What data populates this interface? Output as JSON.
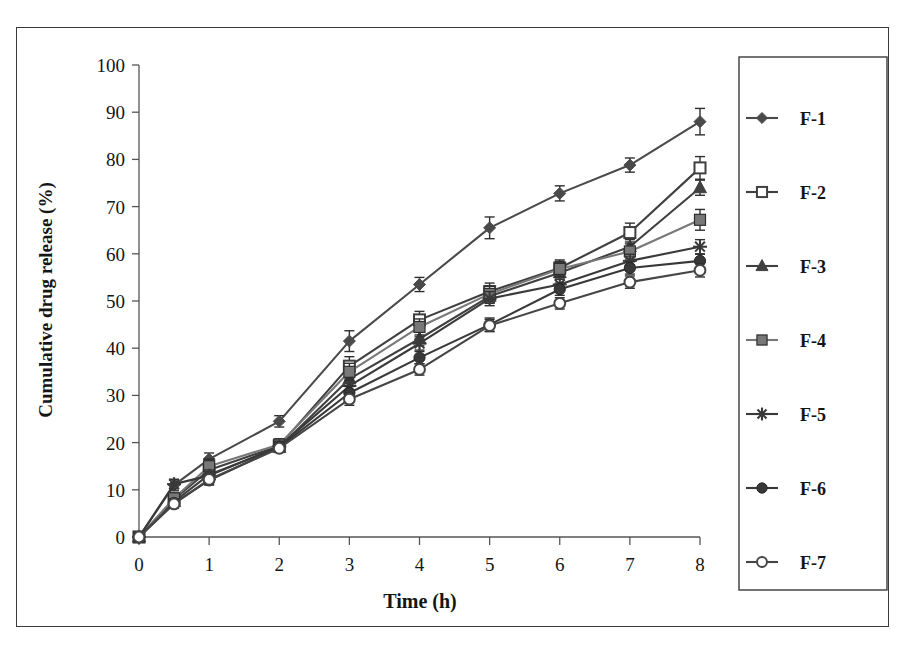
{
  "chart_data": {
    "type": "line",
    "title": "",
    "xlabel": "Time (h)",
    "ylabel": "Cumulative drug release (%)",
    "xlim": [
      0,
      8
    ],
    "ylim": [
      0,
      100
    ],
    "xticks": [
      "0",
      "1",
      "2",
      "3",
      "4",
      "5",
      "6",
      "7",
      "8"
    ],
    "yticks": [
      "0",
      "10",
      "20",
      "30",
      "40",
      "50",
      "60",
      "70",
      "80",
      "90",
      "100"
    ],
    "grid": false,
    "legend_position": "right-outside",
    "error_bars": true,
    "x": [
      0,
      0.5,
      1,
      2,
      3,
      4,
      5,
      6,
      7,
      8
    ],
    "series": [
      {
        "name": "F-1",
        "marker": "filled-diamond",
        "color": "#4a4a4a",
        "values": [
          0,
          11.0,
          16.5,
          24.5,
          41.5,
          53.5,
          65.5,
          72.8,
          78.8,
          88.0
        ],
        "errors": [
          0,
          1.2,
          1.3,
          1.2,
          2.2,
          1.5,
          2.3,
          1.6,
          1.5,
          2.8
        ]
      },
      {
        "name": "F-2",
        "marker": "open-square",
        "color": "#3f3f3f",
        "values": [
          0,
          8.0,
          14.2,
          19.3,
          36.2,
          46.0,
          52.0,
          57.0,
          64.5,
          78.2
        ],
        "errors": [
          0,
          1.0,
          1.4,
          1.2,
          2.0,
          1.8,
          1.8,
          1.7,
          2.0,
          2.4
        ]
      },
      {
        "name": "F-3",
        "marker": "filled-triangle",
        "color": "#404040",
        "values": [
          0,
          7.5,
          13.2,
          19.0,
          33.5,
          42.0,
          51.0,
          56.0,
          61.5,
          74.0
        ],
        "errors": [
          0,
          0.9,
          1.1,
          1.0,
          1.6,
          1.5,
          1.5,
          1.4,
          1.5,
          1.6
        ]
      },
      {
        "name": "F-4",
        "marker": "filled-square",
        "color": "#787878",
        "values": [
          0,
          8.2,
          15.0,
          19.6,
          35.0,
          44.5,
          51.5,
          56.8,
          60.5,
          67.2
        ],
        "errors": [
          0,
          1.1,
          1.5,
          1.2,
          1.8,
          1.7,
          1.7,
          1.6,
          1.6,
          2.2
        ]
      },
      {
        "name": "F-5",
        "marker": "star-asterisk",
        "color": "#3a3a3a",
        "values": [
          0,
          11.2,
          13.0,
          19.2,
          32.0,
          41.0,
          50.5,
          53.5,
          58.5,
          61.5
        ],
        "errors": [
          0,
          1.0,
          1.2,
          1.1,
          1.5,
          1.4,
          1.5,
          1.4,
          1.4,
          1.5
        ]
      },
      {
        "name": "F-6",
        "marker": "filled-circle",
        "color": "#383838",
        "values": [
          0,
          7.2,
          12.0,
          19.0,
          30.5,
          38.0,
          45.0,
          52.5,
          57.0,
          58.5
        ],
        "errors": [
          0,
          0.9,
          1.0,
          1.0,
          1.4,
          1.3,
          1.4,
          1.3,
          1.3,
          1.4
        ]
      },
      {
        "name": "F-7",
        "marker": "open-circle",
        "color": "#454545",
        "values": [
          0,
          7.0,
          12.2,
          18.8,
          29.2,
          35.5,
          44.8,
          49.5,
          54.0,
          56.5
        ],
        "errors": [
          0,
          0.9,
          1.0,
          0.9,
          1.3,
          1.2,
          1.3,
          1.2,
          1.3,
          1.4
        ]
      }
    ]
  },
  "legend": {
    "items": [
      {
        "label": "F-1"
      },
      {
        "label": "F-2"
      },
      {
        "label": "F-3"
      },
      {
        "label": "F-4"
      },
      {
        "label": "F-5"
      },
      {
        "label": "F-6"
      },
      {
        "label": "F-7"
      }
    ]
  }
}
